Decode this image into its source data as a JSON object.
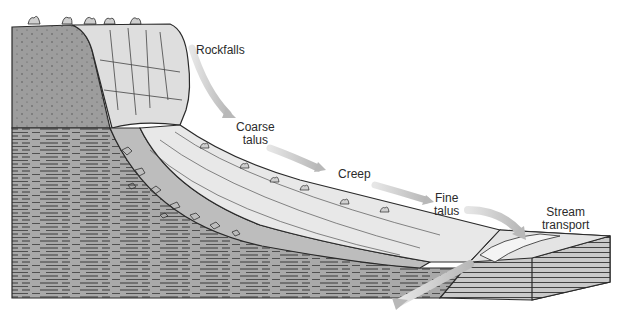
{
  "diagram": {
    "colors": {
      "background": "#ffffff",
      "bedrock_dark": "#9a9a9a",
      "bedrock_strata": "#a8a8a8",
      "cliff_face": "#dcdcdc",
      "slope_surface": "#e6e6e6",
      "talus_fill": "#bdbdbd",
      "arrow": "#c4c4c4",
      "outline": "#2a2a2a",
      "label_text": "#2b2b2b"
    },
    "labels": [
      {
        "id": "rockfalls",
        "lines": [
          "Rockfalls"
        ]
      },
      {
        "id": "coarse-talus",
        "lines": [
          "Coarse",
          "talus"
        ]
      },
      {
        "id": "creep",
        "lines": [
          "Creep"
        ]
      },
      {
        "id": "fine-talus",
        "lines": [
          "Fine",
          "talus"
        ]
      },
      {
        "id": "stream-transport",
        "lines": [
          "Stream",
          "transport"
        ]
      }
    ],
    "arrows": [
      {
        "id": "arrow-rockfalls",
        "direction": "down-slope"
      },
      {
        "id": "arrow-coarse-talus",
        "direction": "down-slope"
      },
      {
        "id": "arrow-creep",
        "direction": "down-slope"
      },
      {
        "id": "arrow-fine-talus",
        "direction": "down-into-stream"
      },
      {
        "id": "arrow-stream-outflow",
        "direction": "down-left-out-of-block"
      }
    ]
  }
}
